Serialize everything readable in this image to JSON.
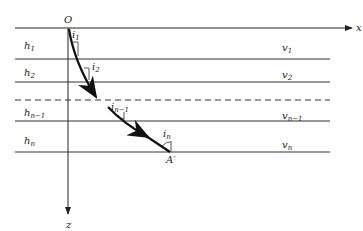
{
  "diagram": {
    "type": "layered-medium ray path",
    "origin_label": "O",
    "axes": {
      "x_label": "x",
      "z_label": "z"
    },
    "layers": [
      {
        "thickness": "h",
        "thickness_sub": "1",
        "velocity": "v",
        "velocity_sub": "1"
      },
      {
        "thickness": "h",
        "thickness_sub": "2",
        "velocity": "v",
        "velocity_sub": "2"
      },
      {
        "thickness": "h",
        "thickness_sub": "n−1",
        "velocity": "v",
        "velocity_sub": "n−1"
      },
      {
        "thickness": "h",
        "thickness_sub": "n",
        "velocity": "v",
        "velocity_sub": "n"
      }
    ],
    "angles": [
      {
        "symbol": "i",
        "sub": "1"
      },
      {
        "symbol": "i",
        "sub": "2"
      },
      {
        "symbol": "i",
        "sub": "n−1"
      },
      {
        "symbol": "i",
        "sub": "n"
      }
    ],
    "endpoint_label": "A′",
    "colors": {
      "line": "#222222",
      "background": "#ffffff"
    }
  }
}
